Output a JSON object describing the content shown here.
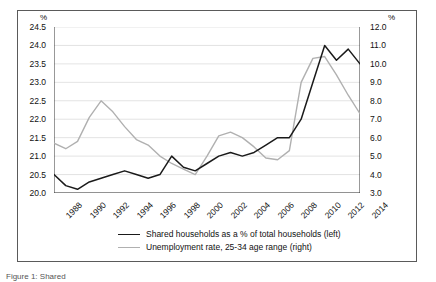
{
  "figure": {
    "caption_partial": "Figure 1:  Shared",
    "frame_color": "#5a5a5a",
    "background": "#ffffff"
  },
  "axes": {
    "left_unit": "%",
    "right_unit": "%",
    "left_ticks": [
      "24.5",
      "24.0",
      "23.5",
      "23.0",
      "22.5",
      "22.0",
      "21.5",
      "21.0",
      "20.5",
      "20.0"
    ],
    "right_ticks": [
      "12.0",
      "11.0",
      "10.0",
      "9.0",
      "8.0",
      "7.0",
      "6.0",
      "5.0",
      "4.0",
      "3.0"
    ],
    "x_ticks": [
      "1988",
      "1990",
      "1992",
      "1994",
      "1996",
      "1998",
      "2000",
      "2002",
      "2004",
      "2006",
      "2008",
      "2010",
      "2012",
      "2014"
    ]
  },
  "legend": {
    "position": "below-plot",
    "entries": [
      {
        "label": "Shared households as a % of total households (left)",
        "color": "#1a1a1a"
      },
      {
        "label": "Unemployment rate, 25-34 age range (right)",
        "color": "#b0b0b0"
      }
    ]
  },
  "chart_data": {
    "type": "line",
    "title": "",
    "subtitle": "",
    "xlabel": "",
    "ylabel": "%",
    "y2label": "%",
    "grid": true,
    "grid_axis": "y",
    "legend_position": "bottom",
    "x": [
      1988,
      1989,
      1990,
      1991,
      1992,
      1993,
      1994,
      1995,
      1996,
      1997,
      1998,
      1999,
      2000,
      2001,
      2002,
      2003,
      2004,
      2005,
      2006,
      2007,
      2008,
      2009,
      2010,
      2011,
      2012,
      2013,
      2014
    ],
    "series": [
      {
        "name": "Shared households as a % of total households (left)",
        "axis": "left",
        "color": "#1a1a1a",
        "ylim": [
          20.0,
          24.5
        ],
        "unit": "%",
        "values": [
          20.5,
          20.2,
          20.1,
          20.3,
          20.4,
          20.5,
          20.6,
          20.5,
          20.4,
          20.5,
          21.0,
          20.7,
          20.6,
          20.8,
          21.0,
          21.1,
          21.0,
          21.1,
          21.3,
          21.5,
          21.5,
          22.0,
          23.0,
          24.0,
          23.6,
          23.9,
          23.5
        ]
      },
      {
        "name": "Unemployment rate, 25-34 age range (right)",
        "axis": "right",
        "color": "#b0b0b0",
        "ylim": [
          3.0,
          12.0
        ],
        "unit": "%",
        "values": [
          5.7,
          5.4,
          5.8,
          7.1,
          8.0,
          7.4,
          6.6,
          5.9,
          5.6,
          5.0,
          4.6,
          4.3,
          4.0,
          5.0,
          6.1,
          6.3,
          6.0,
          5.5,
          4.9,
          4.8,
          5.3,
          9.0,
          10.3,
          10.4,
          9.4,
          8.3,
          7.3
        ]
      }
    ]
  }
}
